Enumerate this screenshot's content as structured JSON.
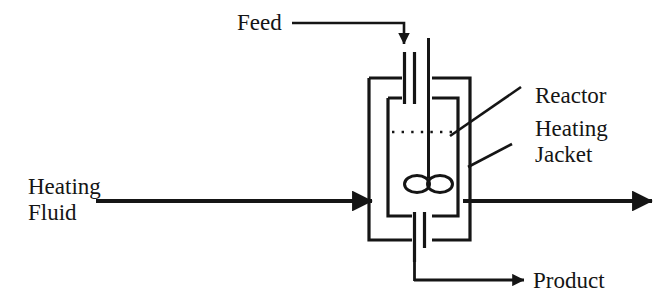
{
  "diagram": {
    "type": "process-flow-diagram",
    "stroke_color": "#151515",
    "background_color": "#ffffff",
    "labels": {
      "feed": "Feed",
      "reactor": "Reactor",
      "heating_jacket_line1": "Heating",
      "heating_jacket_line2": "Jacket",
      "heating_fluid_line1": "Heating",
      "heating_fluid_line2": "Fluid",
      "product": "Product"
    },
    "components": {
      "jacket": "heating-jacket-vessel",
      "reactor_vessel": "inner-reactor-vessel",
      "agitator": "agitator-impeller",
      "agitator_shaft": "agitator-shaft",
      "liquid_level": "liquid-level-dotted-line",
      "feed_pipe": "feed-inlet-pipe",
      "product_pipe": "product-outlet-pipe"
    },
    "streams": [
      {
        "name": "feed",
        "label": "Feed",
        "direction": "down",
        "into": "reactor-vessel"
      },
      {
        "name": "heating-fluid-inlet",
        "label": "Heating Fluid",
        "direction": "right",
        "into": "heating-jacket"
      },
      {
        "name": "heating-fluid-outlet",
        "label": "",
        "direction": "right",
        "from": "heating-jacket"
      },
      {
        "name": "product",
        "label": "Product",
        "direction": "right",
        "from": "reactor-vessel"
      }
    ]
  }
}
